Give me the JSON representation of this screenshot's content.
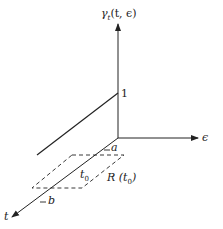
{
  "diagram": {
    "axes": {
      "vertical_label": "γ",
      "vertical_sub": "t",
      "vertical_args": "(t, ϵ)",
      "horizontal_label": "ϵ",
      "depth_label": "t"
    },
    "labels": {
      "unit_mark": "1",
      "a": "a",
      "b": "b",
      "t0": "t",
      "t0_sub": "0",
      "region": "R (t",
      "region_sub": "0",
      "region_close": ")"
    },
    "colors": {
      "ink": "#222222",
      "background": "#ffffff"
    }
  }
}
